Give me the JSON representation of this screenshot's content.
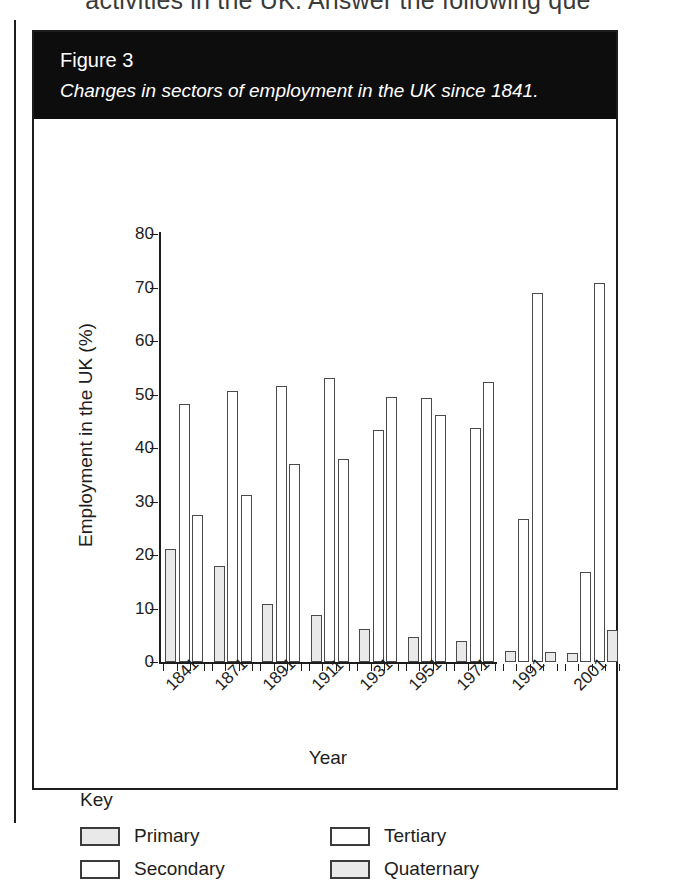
{
  "page": {
    "top_cut_text": "activities in the UK. Answer the following que"
  },
  "figure": {
    "number": "Figure 3",
    "caption": "Changes in sectors of employment in the UK since 1841."
  },
  "key": {
    "title": "Key",
    "items": [
      {
        "label": "Primary",
        "fill": "grey"
      },
      {
        "label": "Tertiary",
        "fill": "white"
      },
      {
        "label": "Secondary",
        "fill": "white"
      },
      {
        "label": "Quaternary",
        "fill": "grey"
      }
    ]
  },
  "colors": {
    "header_bg": "#0d0d0d",
    "header_text": "#ffffff",
    "bar_fill_grey": "#e9e9e9",
    "bar_fill_white": "#ffffff",
    "bar_stroke": "#4a4a4a",
    "axis": "#1d1d1d"
  },
  "chart_data": {
    "type": "bar",
    "title": "Changes in sectors of employment in the UK since 1841.",
    "xlabel": "Year",
    "ylabel": "Employment in the UK (%)",
    "ylim": [
      0,
      80
    ],
    "yticks": [
      0,
      10,
      20,
      30,
      40,
      50,
      60,
      70,
      80
    ],
    "grid": false,
    "legend_position": "below-plot",
    "categories": [
      "1841",
      "1871",
      "1891",
      "1911",
      "1931",
      "1951",
      "1971",
      "1991",
      "2001"
    ],
    "series": [
      {
        "name": "Primary",
        "values": [
          21.2,
          18.0,
          10.8,
          8.8,
          6.2,
          4.6,
          3.9,
          2.1,
          1.6
        ]
      },
      {
        "name": "Secondary",
        "values": [
          48.3,
          50.7,
          51.6,
          53.1,
          43.3,
          49.3,
          43.7,
          26.8,
          16.8
        ]
      },
      {
        "name": "Tertiary",
        "values": [
          27.5,
          31.2,
          37.1,
          37.9,
          49.5,
          46.1,
          52.4,
          68.9,
          70.8
        ]
      },
      {
        "name": "Quaternary",
        "values": [
          null,
          null,
          null,
          null,
          null,
          null,
          null,
          1.9,
          6.0
        ]
      }
    ]
  }
}
